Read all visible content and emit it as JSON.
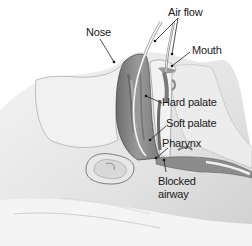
{
  "diagram": {
    "labels": {
      "nose": "Nose",
      "air_flow": "Air flow",
      "mouth": "Mouth",
      "hard_palate": "Hard palate",
      "soft_palate": "Soft palate",
      "pharynx": "Pharynx",
      "blocked_airway_line1": "Blocked",
      "blocked_airway_line2": "airway"
    },
    "colors": {
      "background": "#ffffff",
      "skin": "#e6e6e6",
      "skin_shadow": "#bdbdbd",
      "nasal_cavity": "#8a8a8a",
      "nasal_cavity_dark": "#5e5e5e",
      "outline": "#555555",
      "pillow": "#eeeeee",
      "label_text": "#1a1a1a",
      "leader_line": "#222222"
    }
  }
}
